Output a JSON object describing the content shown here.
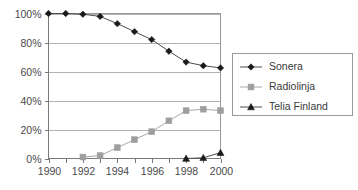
{
  "chart_data": {
    "type": "line",
    "title": "",
    "subtitle": "",
    "xlabel": "",
    "ylabel": "",
    "x": [
      1990,
      1991,
      1992,
      1993,
      1994,
      1995,
      1996,
      1997,
      1998,
      1999,
      2000
    ],
    "xlim": [
      1990,
      2000
    ],
    "ylim": [
      0,
      100
    ],
    "y_tick_values": [
      0,
      20,
      40,
      60,
      80,
      100
    ],
    "y_tick_labels": [
      "0%",
      "20%",
      "40%",
      "60%",
      "80%",
      "100%"
    ],
    "x_tick_values": [
      1990,
      1991,
      1992,
      1993,
      1994,
      1995,
      1996,
      1997,
      1998,
      1999,
      2000
    ],
    "x_tick_labels": [
      "1990",
      "",
      "1992",
      "",
      "1994",
      "",
      "1996",
      "",
      "1998",
      "",
      "2000"
    ],
    "grid": "horizontal",
    "legend_position": "right",
    "series": [
      {
        "name": "Sonera",
        "marker": "diamond",
        "color": "#1a1a1a",
        "line_color": "#4d4d4d",
        "values": [
          100,
          100,
          99.5,
          98,
          93,
          87.5,
          82,
          74,
          66.5,
          64,
          62.5
        ]
      },
      {
        "name": "Radiolinja",
        "marker": "square",
        "color": "#9e9e9e",
        "line_color": "#a8a8a8",
        "values": [
          null,
          null,
          1,
          2,
          7.5,
          13,
          18.5,
          26,
          33,
          34,
          33
        ]
      },
      {
        "name": "Telia Finland",
        "marker": "triangle",
        "color": "#1a1a1a",
        "line_color": "#4d4d4d",
        "values": [
          null,
          null,
          null,
          null,
          null,
          null,
          null,
          null,
          0,
          0.5,
          4
        ]
      }
    ]
  },
  "legend": {
    "entries": [
      {
        "label": "Sonera",
        "marker": "diamond-marker-icon"
      },
      {
        "label": "Radiolinja",
        "marker": "square-marker-icon"
      },
      {
        "label": "Telia Finland",
        "marker": "triangle-marker-icon"
      }
    ]
  },
  "colors": {
    "background": "#ffffff",
    "gridline": "#b3b3b3",
    "axis": "#7a7a7a",
    "border": "#9a9a9a",
    "dark_series": "#1a1a1a",
    "gray_series": "#9e9e9e",
    "text": "#4a4a4a"
  }
}
